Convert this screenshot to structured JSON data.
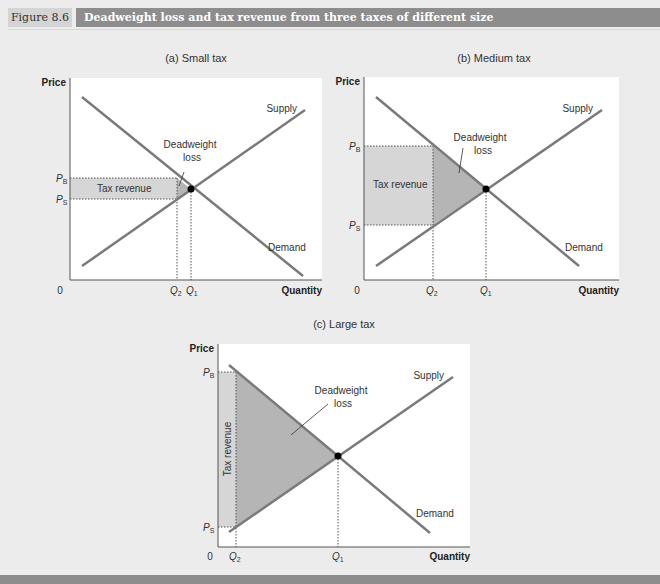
{
  "header": {
    "figure_number": "Figure 8.6",
    "title": "Deadweight loss and tax revenue from three taxes of different size"
  },
  "labels": {
    "price": "Price",
    "quantity": "Quantity",
    "origin": "0",
    "supply": "Supply",
    "demand": "Demand",
    "dwl_line1": "Deadweight",
    "dwl_line2": "loss",
    "tax_revenue": "Tax revenue",
    "pb": "P",
    "pb_sub": "B",
    "ps": "P",
    "ps_sub": "S",
    "q1": "Q",
    "q1_sub": "1",
    "q2": "Q",
    "q2_sub": "2"
  },
  "panels": [
    {
      "id": "a",
      "title": "(a) Small tax"
    },
    {
      "id": "b",
      "title": "(b) Medium tax"
    },
    {
      "id": "c",
      "title": "(c) Large tax"
    }
  ],
  "colors": {
    "curve": "#7a7a7a",
    "tax_revenue_fill": "#d6d6d6",
    "dwl_fill": "#b5b5b5",
    "plot_bg": "#ffffff",
    "page_bg": "#ececec",
    "header_bar": "#8d8d8d"
  }
}
